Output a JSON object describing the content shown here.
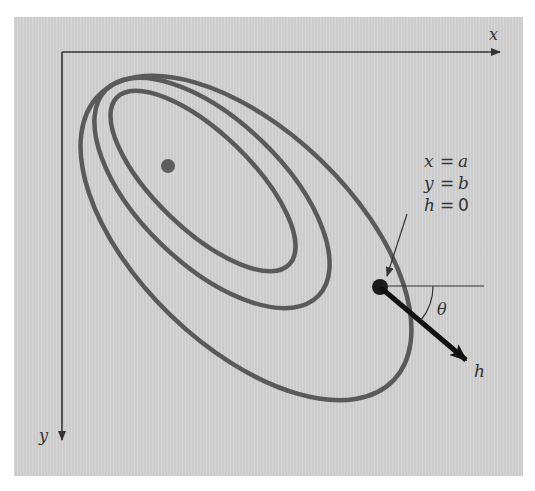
{
  "diagram": {
    "axes": {
      "x_label": "x",
      "y_label": "y"
    },
    "contours": {
      "count": 3,
      "color": "#5a5a5a",
      "center_dot_color": "#5e5e5e"
    },
    "point": {
      "label_lines": [
        {
          "var": "x",
          "eq": "=",
          "val": "a"
        },
        {
          "var": "y",
          "eq": "=",
          "val": "b"
        },
        {
          "var": "h",
          "eq": "=",
          "val": "0"
        }
      ],
      "color": "#1a1a1a"
    },
    "direction": {
      "vector_label": "h",
      "angle_label": "θ"
    },
    "colors": {
      "panel": "#d2d2d2",
      "axis": "#333333",
      "text": "#333333"
    }
  }
}
